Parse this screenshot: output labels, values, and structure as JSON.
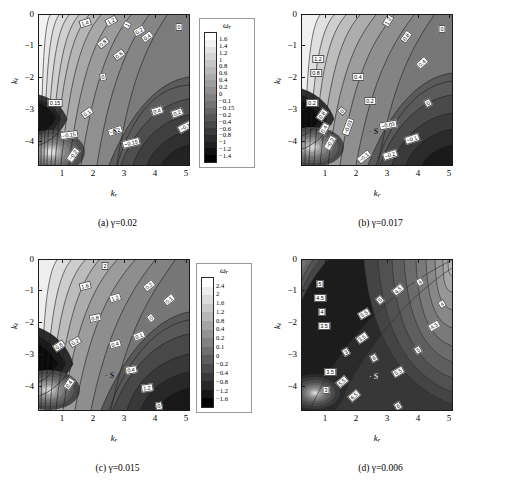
{
  "figure": {
    "axis_x_label": "k",
    "axis_x_sub": "r",
    "axis_y_label": "k",
    "axis_y_sub": "i",
    "colorbar_title": "ω",
    "colorbar_title_sub": "r",
    "saddle_marker": "· S",
    "xticks": [
      "1",
      "2",
      "3",
      "4",
      "5"
    ],
    "yticks": [
      "0",
      "−1",
      "−2",
      "−3",
      "−4"
    ]
  },
  "chart_data": [
    {
      "type": "heatmap",
      "panel": "a",
      "caption": "(a)  γ=0.02",
      "gamma": 0.02,
      "title": "",
      "xlabel": "k_r",
      "ylabel": "k_i",
      "xlim": [
        0.2,
        5.2
      ],
      "ylim": [
        -4.6,
        0.1
      ],
      "xtick_values": [
        1,
        2,
        3,
        4,
        5
      ],
      "ytick_values": [
        0,
        -1,
        -2,
        -3,
        -4
      ],
      "grid": false,
      "legend": "colorbar-right",
      "colorbar_label": "ω_r",
      "colorbar_levels": [
        "1.6",
        "1.4",
        "1.2",
        "1",
        "0.8",
        "0.6",
        "0.4",
        "0.2",
        "0",
        "−0.1",
        "−0.15",
        "−0.2",
        "−0.4",
        "−0.6",
        "−0.8",
        "−1",
        "−1.2",
        "−1.4"
      ],
      "contour_labels": [
        "1.4",
        "1.2",
        "1",
        "0.8",
        "0.6",
        "0.4",
        "0.2",
        "0",
        "0.15",
        "0.1",
        "0.4",
        "0.2",
        "−0.1",
        "−0.15",
        "−0.2",
        "−0.15",
        "−0.2",
        "0"
      ],
      "annotations": [
        "S"
      ]
    },
    {
      "type": "heatmap",
      "panel": "b",
      "caption": "(b)  γ=0.017",
      "gamma": 0.017,
      "title": "",
      "xlabel": "k_r",
      "ylabel": "k_i",
      "xlim": [
        0.2,
        5.2
      ],
      "ylim": [
        -4.6,
        0.1
      ],
      "xtick_values": [
        1,
        2,
        3,
        4,
        5
      ],
      "ytick_values": [
        0,
        -1,
        -2,
        -3,
        -4
      ],
      "grid": false,
      "legend": "colorbar-right",
      "colorbar_label": "ω_r",
      "colorbar_levels": [
        "2",
        "1.6",
        "1.2",
        "0.8",
        "0.4",
        "0.2",
        "0",
        "−0.03",
        "−0.1",
        "−0.2",
        "−0.4",
        "−0.6",
        "−0.8",
        "−1.2",
        "−1.6"
      ],
      "contour_labels": [
        "1.2",
        "1.2",
        "0.8",
        "0.8",
        "0.4",
        "0.4",
        "0.2",
        "0.2",
        "0",
        "0",
        "−0.03",
        "−0.03",
        "−0.1",
        "−0.1",
        "−0.2",
        "−0.2",
        "0.8",
        "0.4",
        "0"
      ],
      "annotations": [
        "S"
      ]
    },
    {
      "type": "heatmap",
      "panel": "c",
      "caption": "(c)  γ=0.015",
      "gamma": 0.015,
      "title": "",
      "xlabel": "k_r",
      "ylabel": "k_i",
      "xlim": [
        0.2,
        5.2
      ],
      "ylim": [
        -4.6,
        0.1
      ],
      "xtick_values": [
        1,
        2,
        3,
        4,
        5
      ],
      "ytick_values": [
        0,
        -1,
        -2,
        -3,
        -4
      ],
      "grid": false,
      "legend": "colorbar-right",
      "colorbar_label": "ω_r",
      "colorbar_levels": [
        "2.4",
        "2",
        "1.6",
        "1.2",
        "0.8",
        "0.4",
        "0.2",
        "0.1",
        "0",
        "−0.2",
        "−0.4",
        "−0.8",
        "−1.2",
        "−1.6"
      ],
      "contour_labels": [
        "2",
        "1.6",
        "1.2",
        "0.8",
        "0.4",
        "0.2",
        "0.1",
        "0",
        "0.1",
        "0.2",
        "0.4",
        "1.2",
        "0.8",
        "0.4",
        "0"
      ],
      "annotations": [
        "S"
      ]
    },
    {
      "type": "heatmap",
      "panel": "d",
      "caption": "(d)  γ=0.006",
      "gamma": 0.006,
      "title": "",
      "xlabel": "k_r",
      "ylabel": "k_i",
      "xlim": [
        0.2,
        5.2
      ],
      "ylim": [
        -4.6,
        0.1
      ],
      "xtick_values": [
        1,
        2,
        3,
        4,
        5
      ],
      "ytick_values": [
        0,
        -1,
        -2,
        -3,
        -4
      ],
      "grid": false,
      "legend": "colorbar-right",
      "colorbar_label": "ω_r",
      "colorbar_levels": [
        "10",
        "9",
        "8",
        "7",
        "6.5",
        "6",
        "5.5",
        "5",
        "4.5",
        "4",
        "3.5",
        "3.3",
        "3",
        "2",
        "1",
        "0",
        "−1"
      ],
      "contour_labels": [
        "5",
        "4.5",
        "4",
        "3.5",
        "5.5",
        "5",
        "4.5",
        "4",
        "3.5",
        "3",
        "6",
        "5.5",
        "5",
        "4.5",
        "4",
        "3.5",
        "3",
        "6.5",
        "6",
        "5.5"
      ],
      "annotations": [
        "S"
      ]
    }
  ]
}
